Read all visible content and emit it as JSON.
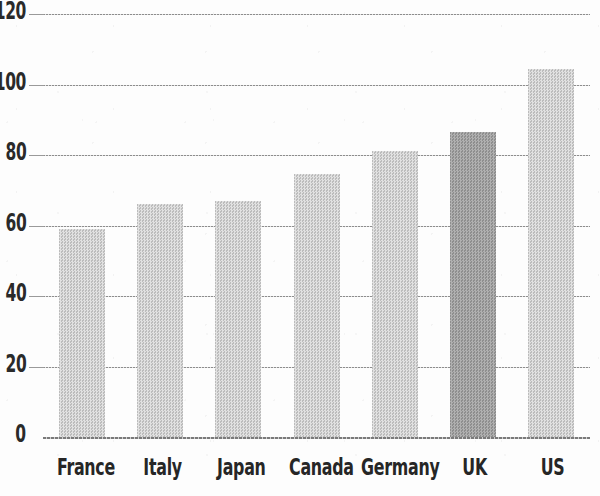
{
  "chart_data": {
    "type": "bar",
    "title": "",
    "subtitle": "",
    "xlabel": "",
    "ylabel": "",
    "categories": [
      "France",
      "Italy",
      "Japan",
      "Canada",
      "Germany",
      "UK",
      "US"
    ],
    "values": [
      59,
      66,
      67,
      74.5,
      81,
      86.5,
      104.5
    ],
    "ylim": [
      0,
      120
    ],
    "yticks": [
      0,
      20,
      40,
      60,
      80,
      100,
      120
    ],
    "ytick_labels": [
      "0",
      "20",
      "40",
      "60",
      "80",
      "100",
      "120"
    ],
    "grid": true,
    "grid_axis": "y",
    "legend": false,
    "legend_position": "none",
    "annotations": [],
    "bar_colors": [
      "#bcbcbc",
      "#bcbcbc",
      "#bcbcbc",
      "#bcbcbc",
      "#bcbcbc",
      "#8e8e8e",
      "#bcbcbc"
    ],
    "highlight_category": "UK",
    "colors": {
      "bar_default": "#bcbcbc",
      "bar_highlight": "#8e8e8e",
      "gridline": "#8d8d8d",
      "axis": "#7a7a7a",
      "text": "#262626",
      "background": "#fdfdfd"
    }
  }
}
